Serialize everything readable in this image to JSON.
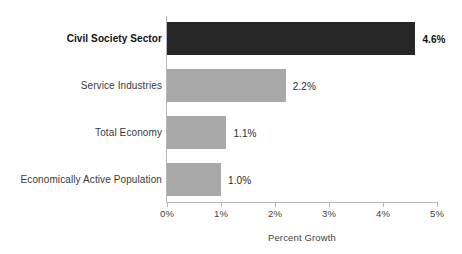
{
  "chart_data": {
    "type": "bar",
    "orientation": "horizontal",
    "title": "",
    "xlabel": "Percent Growth",
    "ylabel": "",
    "xlim": [
      0,
      5
    ],
    "xtick_labels": [
      "0%",
      "1%",
      "2%",
      "3%",
      "4%",
      "5%"
    ],
    "xtick_values": [
      0,
      1,
      2,
      3,
      4,
      5
    ],
    "grid": false,
    "legend": false,
    "categories": [
      "Civil Society Sector",
      "Service Industries",
      "Total Economy",
      "Economically Active Population"
    ],
    "values": [
      4.6,
      2.2,
      1.1,
      1.0
    ],
    "value_labels": [
      "4.6%",
      "2.2%",
      "1.1%",
      "1.0%"
    ],
    "bar_colors": [
      "#262626",
      "#a9a9a9",
      "#a9a9a9",
      "#a9a9a9"
    ],
    "highlighted_category": "Civil Society Sector",
    "bars": [
      {
        "category": "Civil Society Sector",
        "value": 4.6,
        "value_label": "4.6%",
        "color": "#262626",
        "emphasis": true
      },
      {
        "category": "Service Industries",
        "value": 2.2,
        "value_label": "2.2%",
        "color": "#a9a9a9",
        "emphasis": false
      },
      {
        "category": "Total Economy",
        "value": 1.1,
        "value_label": "1.1%",
        "color": "#a9a9a9",
        "emphasis": false
      },
      {
        "category": "Economically Active Population",
        "value": 1.0,
        "value_label": "1.0%",
        "color": "#a9a9a9",
        "emphasis": false
      }
    ]
  },
  "colors": {
    "background": "#ffffff",
    "axis": "#b8b8b8",
    "text": "#3a3a3a",
    "bar_highlight": "#262626",
    "bar_default": "#a9a9a9"
  }
}
